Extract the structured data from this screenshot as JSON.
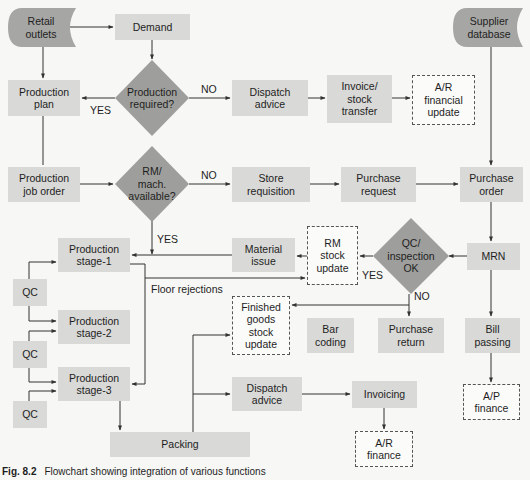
{
  "diagram": {
    "type": "flowchart",
    "caption": {
      "figure_number": "Fig. 8.2",
      "text": "Flowchart showing integration of various functions"
    },
    "colors": {
      "process_fill": "#d9d9d7",
      "decision_fill": "#9e9e9c",
      "data_store_fill": "#a6a6a4",
      "update_border": "#555555",
      "line": "#333333"
    },
    "nodes": {
      "retail_outlets": {
        "label": "Retail\noutlets",
        "shape": "data-store"
      },
      "demand": {
        "label": "Demand",
        "shape": "process"
      },
      "production_required": {
        "label": "Production\nrequired?",
        "shape": "decision"
      },
      "production_plan": {
        "label": "Production\nplan",
        "shape": "process"
      },
      "dispatch_advice_top": {
        "label": "Dispatch\nadvice",
        "shape": "process"
      },
      "invoice_stock_transfer": {
        "label": "Invoice/\nstock\ntransfer",
        "shape": "process"
      },
      "ar_financial_update": {
        "label": "A/R\nfinancial\nupdate",
        "shape": "dashed-update"
      },
      "supplier_database": {
        "label": "Supplier\ndatabase",
        "shape": "data-store"
      },
      "production_job_order": {
        "label": "Production\njob order",
        "shape": "process"
      },
      "rm_mach_available": {
        "label": "RM/\nmach.\navailable?",
        "shape": "decision"
      },
      "store_requisition": {
        "label": "Store\nrequisition",
        "shape": "process"
      },
      "purchase_request": {
        "label": "Purchase\nrequest",
        "shape": "process"
      },
      "purchase_order": {
        "label": "Purchase\norder",
        "shape": "process"
      },
      "mrn": {
        "label": "MRN",
        "shape": "process"
      },
      "qc_inspection_ok": {
        "label": "QC/\ninspection\nOK",
        "shape": "decision"
      },
      "rm_stock_update": {
        "label": "RM\nstock\nupdate",
        "shape": "dashed-update"
      },
      "material_issue": {
        "label": "Material\nissue",
        "shape": "process"
      },
      "production_stage_1": {
        "label": "Production\nstage-1",
        "shape": "process"
      },
      "production_stage_2": {
        "label": "Production\nstage-2",
        "shape": "process"
      },
      "production_stage_3": {
        "label": "Production\nstage-3",
        "shape": "process"
      },
      "qc_1": {
        "label": "QC",
        "shape": "process"
      },
      "qc_2": {
        "label": "QC",
        "shape": "process"
      },
      "qc_3": {
        "label": "QC",
        "shape": "process"
      },
      "finished_goods_stock_update": {
        "label": "Finished\ngoods\nstock\nupdate",
        "shape": "dashed-update"
      },
      "bar_coding": {
        "label": "Bar\ncoding",
        "shape": "process"
      },
      "purchase_return": {
        "label": "Purchase\nreturn",
        "shape": "process"
      },
      "bill_passing": {
        "label": "Bill\npassing",
        "shape": "process"
      },
      "dispatch_advice_bottom": {
        "label": "Dispatch\nadvice",
        "shape": "process"
      },
      "invoicing": {
        "label": "Invoicing",
        "shape": "process"
      },
      "ap_finance": {
        "label": "A/P\nfinance",
        "shape": "dashed-update"
      },
      "packing": {
        "label": "Packing",
        "shape": "process"
      },
      "ar_finance": {
        "label": "A/R\nfinance",
        "shape": "dashed-update"
      }
    },
    "edge_labels": {
      "prod_req_yes": "YES",
      "prod_req_no": "NO",
      "rm_no": "NO",
      "rm_yes": "YES",
      "qc_yes": "YES",
      "qc_no": "NO",
      "floor_rejections": "Floor rejections"
    },
    "edges": [
      {
        "from": "retail_outlets",
        "to": "demand"
      },
      {
        "from": "retail_outlets",
        "to": "production_plan"
      },
      {
        "from": "demand",
        "to": "production_required"
      },
      {
        "from": "production_required",
        "to": "production_plan",
        "label": "YES"
      },
      {
        "from": "production_required",
        "to": "dispatch_advice_top",
        "label": "NO"
      },
      {
        "from": "dispatch_advice_top",
        "to": "invoice_stock_transfer"
      },
      {
        "from": "invoice_stock_transfer",
        "to": "ar_financial_update"
      },
      {
        "from": "production_plan",
        "to": "production_job_order"
      },
      {
        "from": "production_job_order",
        "to": "rm_mach_available"
      },
      {
        "from": "rm_mach_available",
        "to": "store_requisition",
        "label": "NO"
      },
      {
        "from": "rm_mach_available",
        "to": "production_stage_1",
        "label": "YES"
      },
      {
        "from": "store_requisition",
        "to": "purchase_request"
      },
      {
        "from": "purchase_request",
        "to": "purchase_order"
      },
      {
        "from": "supplier_database",
        "to": "purchase_order"
      },
      {
        "from": "purchase_order",
        "to": "mrn"
      },
      {
        "from": "mrn",
        "to": "qc_inspection_ok"
      },
      {
        "from": "mrn",
        "to": "bill_passing"
      },
      {
        "from": "qc_inspection_ok",
        "to": "rm_stock_update",
        "label": "YES"
      },
      {
        "from": "qc_inspection_ok",
        "to": "purchase_return",
        "label": "NO"
      },
      {
        "from": "qc_inspection_ok",
        "to": "finished_goods_stock_update"
      },
      {
        "from": "rm_stock_update",
        "to": "material_issue"
      },
      {
        "from": "material_issue",
        "to": "production_stage_1"
      },
      {
        "from": "production_stage_1",
        "to": "rm_stock_update",
        "label": "Floor rejections"
      },
      {
        "from": "production_stage_1",
        "to": "production_stage_3"
      },
      {
        "from": "qc_1",
        "to": "production_stage_1"
      },
      {
        "from": "qc_1",
        "to": "production_stage_2"
      },
      {
        "from": "qc_2",
        "to": "production_stage_2"
      },
      {
        "from": "qc_2",
        "to": "production_stage_3"
      },
      {
        "from": "qc_3",
        "to": "production_stage_3"
      },
      {
        "from": "production_stage_3",
        "to": "packing"
      },
      {
        "from": "packing",
        "to": "finished_goods_stock_update"
      },
      {
        "from": "packing",
        "to": "dispatch_advice_bottom"
      },
      {
        "from": "dispatch_advice_bottom",
        "to": "invoicing"
      },
      {
        "from": "invoicing",
        "to": "ar_finance"
      },
      {
        "from": "bill_passing",
        "to": "ap_finance"
      }
    ]
  }
}
